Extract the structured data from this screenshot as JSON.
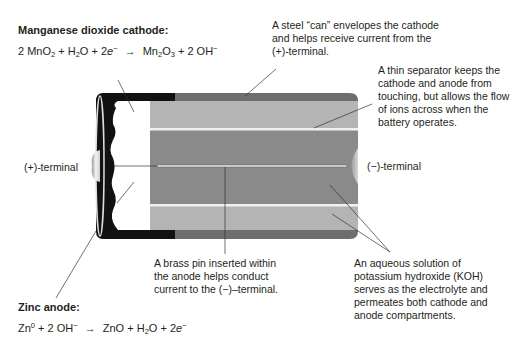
{
  "cathode": {
    "title": "Manganese dioxide cathode:",
    "equation": {
      "lhs": [
        "2 MnO",
        "2",
        " + H",
        "2",
        "O + 2",
        "e",
        "−"
      ],
      "arrow": "→",
      "rhs": [
        "Mn",
        "2",
        "O",
        "3",
        " + 2 OH",
        "−"
      ]
    }
  },
  "anode": {
    "title": "Zinc anode:",
    "equation": {
      "lhs": [
        "Zn",
        "0",
        " + 2 OH",
        "−"
      ],
      "arrow": "→",
      "rhs": [
        "ZnO + H",
        "2",
        "O + 2",
        "e",
        "−"
      ]
    }
  },
  "labels": {
    "positive_terminal": "(+)-terminal",
    "negative_terminal": "(−)-terminal"
  },
  "callouts": {
    "steel_can": [
      "A steel “can” envelopes the cathode",
      "and helps receive current from the",
      "(+)-terminal."
    ],
    "separator": [
      "A thin separator keeps the",
      "cathode and anode from",
      "touching, but allows the flow",
      "of ions across when the",
      "battery operates."
    ],
    "brass_pin": [
      "A brass pin inserted within",
      "the anode helps conduct",
      "current to the (−)–terminal."
    ],
    "electrolyte": [
      "An aqueous solution of",
      "potassium hydroxide (KOH)",
      "serves as the electrolyte and",
      "permeates both cathode and",
      "anode compartments."
    ]
  },
  "colors": {
    "can": "#6e6e6e",
    "cathode": "#b4b4b4",
    "anode": "#8a8a8a",
    "separator": "#f0f0f0",
    "cap": "#111111",
    "pin": "#c8c8c8"
  }
}
